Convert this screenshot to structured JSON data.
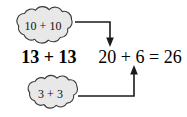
{
  "diagram": {
    "type": "math-decomposition",
    "background_color": "#ffffff",
    "cloud_fill_color": "#e8e8e8",
    "cloud_stroke_color": "#3a3a3a",
    "arrow_color": "#1a1a1a",
    "text_color": "#000000"
  },
  "clouds": {
    "top": {
      "label": "10 + 10",
      "addends": [
        10,
        10
      ],
      "sum": 20
    },
    "bottom": {
      "label": "3 + 3",
      "addends": [
        3,
        3
      ],
      "sum": 6
    }
  },
  "expressions": {
    "bold_problem": "13 + 13",
    "result_equation": "20 + 6 = 26"
  },
  "arrows": {
    "top": {
      "name": "arrow-from-tens-cloud",
      "direction": "down",
      "points_to": "20"
    },
    "bottom": {
      "name": "arrow-from-ones-cloud",
      "direction": "up",
      "points_to": "6"
    }
  }
}
